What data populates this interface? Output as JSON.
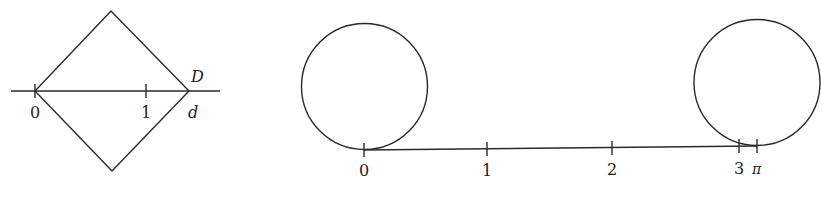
{
  "figures": [
    {
      "id": "diamond",
      "description": "Square rotated 45 degrees with diagonal on number line from 0 to d",
      "axis_labels": {
        "zero": "0",
        "one": "1",
        "end": "d"
      },
      "vertex_label": "D"
    },
    {
      "id": "rolling-circle",
      "description": "Unit-diameter circle rolled along number line from 0 to pi",
      "axis_labels": [
        "0",
        "1",
        "2",
        "3",
        "π"
      ]
    }
  ],
  "colors": {
    "stroke": "#2a2a2a",
    "background": "#ffffff"
  }
}
